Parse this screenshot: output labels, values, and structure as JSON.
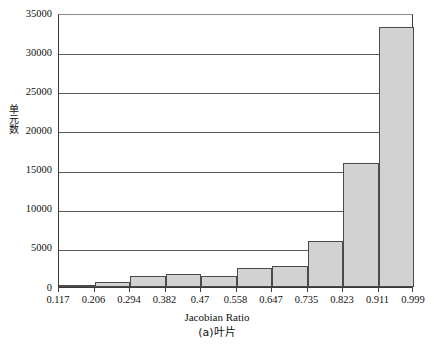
{
  "chart_data": {
    "type": "bar",
    "title": "",
    "subtitle": "",
    "xlabel": "Jacobian Ratio",
    "ylabel": "单元数",
    "caption": "(a)叶片",
    "categories": [
      "0.117–0.206",
      "0.206–0.294",
      "0.294–0.382",
      "0.382–0.47",
      "0.47–0.558",
      "0.558–0.647",
      "0.647–0.735",
      "0.735–0.823",
      "0.823–0.911",
      "0.911–0.999"
    ],
    "values": [
      200,
      700,
      1400,
      1600,
      1400,
      2400,
      2700,
      5900,
      15900,
      33200
    ],
    "bin_edges": [
      0.117,
      0.206,
      0.294,
      0.382,
      0.47,
      0.558,
      0.647,
      0.735,
      0.823,
      0.911,
      0.999
    ],
    "xtick_labels": [
      "0.117",
      "0.206",
      "0.294",
      "0.382",
      "0.47",
      "0.558",
      "0.647",
      "0.735",
      "0.823",
      "0.911",
      "0.999"
    ],
    "ytick_labels": [
      "0",
      "5000",
      "10000",
      "15000",
      "20000",
      "25000",
      "30000",
      "35000"
    ],
    "ytick_values": [
      0,
      5000,
      10000,
      15000,
      20000,
      25000,
      30000,
      35000
    ],
    "ylim": [
      0,
      35000
    ],
    "grid": "horizontal",
    "legend": "none",
    "bar_fill_color": "#d2d2d2",
    "bar_edge_color": "#4a4a4a",
    "axis_color": "#3a3a3a",
    "grid_color": "#5a5a5a"
  }
}
